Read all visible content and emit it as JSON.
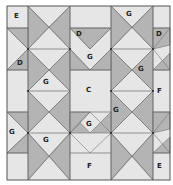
{
  "colors": {
    "light": "#e6e6e6",
    "medium": "#bdbdbd",
    "dark": "#a8a8a8",
    "line": "#6a6a6a",
    "border": "#555555",
    "background": "#ffffff"
  },
  "quilt": {
    "bounds": {
      "x0": 7,
      "y0": 6,
      "x1": 170,
      "y1": 180
    },
    "col_lines": [
      7,
      28,
      70,
      111,
      153,
      170
    ],
    "row_lines": [
      6,
      28,
      49,
      70,
      91,
      112,
      133,
      153,
      180
    ],
    "labels": [
      {
        "text": "E",
        "x": 14,
        "y": 17
      },
      {
        "text": "G",
        "x": 128,
        "y": 15
      },
      {
        "text": "D",
        "x": 78,
        "y": 35
      },
      {
        "text": "D",
        "x": 157,
        "y": 35
      },
      {
        "text": "D",
        "x": 19,
        "y": 64
      },
      {
        "text": "G",
        "x": 89,
        "y": 58
      },
      {
        "text": "G",
        "x": 140,
        "y": 70
      },
      {
        "text": "G",
        "x": 45,
        "y": 83
      },
      {
        "text": "C",
        "x": 88,
        "y": 91
      },
      {
        "text": "F",
        "x": 158,
        "y": 92
      },
      {
        "text": "G",
        "x": 113,
        "y": 111
      },
      {
        "text": "G",
        "x": 88,
        "y": 125
      },
      {
        "text": "G",
        "x": 11,
        "y": 133
      },
      {
        "text": "G",
        "x": 45,
        "y": 141
      },
      {
        "text": "F",
        "x": 89,
        "y": 167
      },
      {
        "text": "E",
        "x": 159,
        "y": 167
      }
    ]
  }
}
